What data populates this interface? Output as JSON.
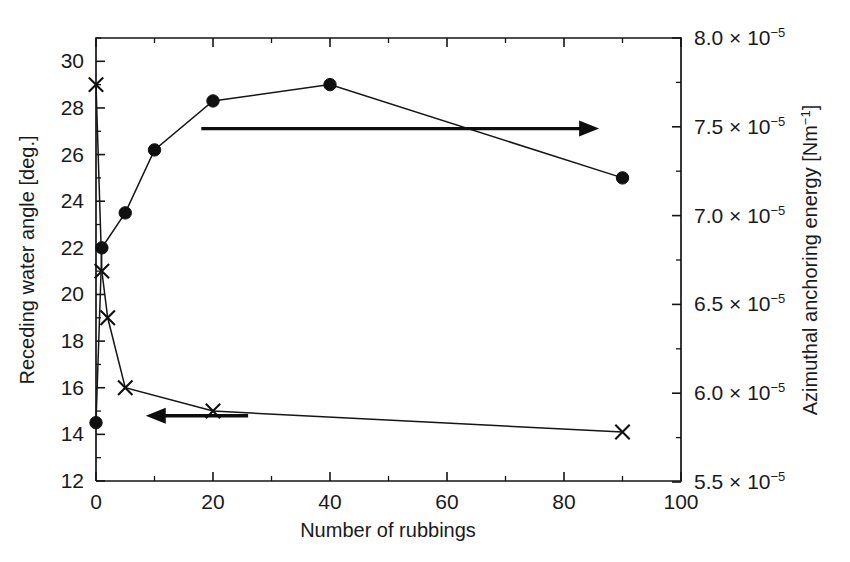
{
  "chart_data": {
    "type": "line",
    "title": "",
    "xlabel": "Number of rubbings",
    "ylabel": "Receding water angle [deg.]",
    "y2label": "Azimuthal anchoring energy [Nm⁻¹]",
    "xlim": [
      0,
      100
    ],
    "ylim": [
      12,
      31
    ],
    "y2lim": [
      5.4,
      8.0
    ],
    "grid": false,
    "legend": "none",
    "x_ticks": [
      0,
      20,
      40,
      60,
      80,
      100
    ],
    "x_tick_labels": [
      "0",
      "20",
      "40",
      "60",
      "80",
      "100"
    ],
    "x_minor_step": 10,
    "y_ticks": [
      12,
      14,
      16,
      18,
      20,
      22,
      24,
      26,
      28,
      30
    ],
    "y_tick_labels": [
      "12",
      "14",
      "16",
      "18",
      "20",
      "22",
      "24",
      "26",
      "28",
      "30"
    ],
    "y_minor_step": 1,
    "y2_ticks": [
      5.5,
      6.0,
      6.5,
      7.0,
      7.5,
      8.0
    ],
    "y2_tick_mantissas": [
      "5.5",
      "6.0",
      "6.5",
      "7.0",
      "7.5",
      "8.0"
    ],
    "y2_tick_exponent": "−5",
    "y2_tick_base": "× 10",
    "y2_minor_step": 0.25,
    "series": [
      {
        "name": "Receding water angle",
        "marker": "cross",
        "axis": "left",
        "points": [
          {
            "x": 0,
            "y": 29.0
          },
          {
            "x": 1,
            "y": 21.0
          },
          {
            "x": 2,
            "y": 19.0
          },
          {
            "x": 5,
            "y": 16.0
          },
          {
            "x": 20,
            "y": 15.0
          },
          {
            "x": 90,
            "y": 14.1
          }
        ]
      },
      {
        "name": "Azimuthal anchoring energy",
        "marker": "dot",
        "axis": "right",
        "points_left_scale": [
          {
            "x": 0,
            "y": 14.5
          },
          {
            "x": 1,
            "y": 22.0
          },
          {
            "x": 5,
            "y": 23.5
          },
          {
            "x": 10,
            "y": 26.2
          },
          {
            "x": 20,
            "y": 28.3
          },
          {
            "x": 40,
            "y": 29.0
          },
          {
            "x": 90,
            "y": 25.0
          }
        ],
        "points": [
          {
            "x": 0,
            "y": 5.57e-05
          },
          {
            "x": 1,
            "y": 6.6e-05
          },
          {
            "x": 5,
            "y": 6.78e-05
          },
          {
            "x": 10,
            "y": 7.08e-05
          },
          {
            "x": 20,
            "y": 7.32e-05
          },
          {
            "x": 40,
            "y": 7.4e-05
          },
          {
            "x": 90,
            "y": 7.06e-05
          }
        ]
      }
    ],
    "annotations": [
      {
        "name": "arrow-to-right-axis",
        "text": "",
        "direction": "right",
        "x_start": 18,
        "x_end": 86,
        "y_value": 7.49e-05,
        "axis": "right"
      },
      {
        "name": "arrow-to-left-axis",
        "text": "",
        "direction": "left",
        "x_start": 26,
        "x_end": 8.5,
        "y_value": 14.8,
        "axis": "left"
      }
    ]
  }
}
